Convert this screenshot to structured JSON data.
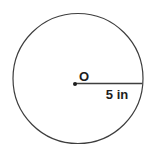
{
  "figure": {
    "type": "circle-diagram",
    "center_label": "O",
    "radius_label": "5 in",
    "radius_value": 5,
    "radius_unit": "in"
  },
  "colors": {
    "background": "#ffffff",
    "stroke": "#3e3e3e",
    "text": "#1d1d1d"
  }
}
